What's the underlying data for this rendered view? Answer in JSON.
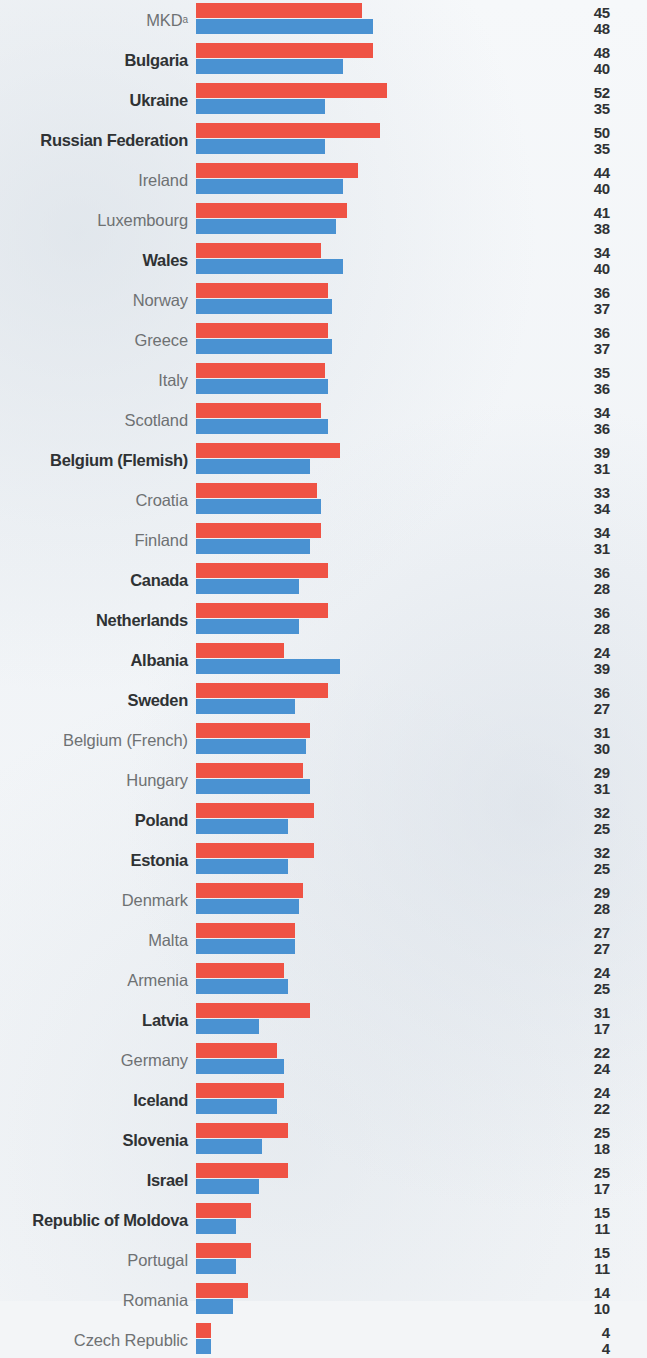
{
  "chart_data": {
    "type": "bar",
    "orientation": "horizontal",
    "grouping": "grouped",
    "title": "",
    "subtitle": "",
    "xlabel": "",
    "ylabel": "",
    "xlim": [
      0,
      55
    ],
    "grid": false,
    "legend": "none",
    "value_labels_side": "right",
    "colors": {
      "series_1": "#ef5345",
      "series_2": "#4a92d2",
      "background": "#f3f5f7",
      "label_regular": "#6e7173",
      "label_bold": "#2f3234",
      "value_text": "#2f3234"
    },
    "series": [
      {
        "name": "series_1",
        "color": "#ef5345",
        "values": [
          45,
          48,
          52,
          50,
          44,
          41,
          34,
          36,
          36,
          35,
          34,
          39,
          33,
          34,
          36,
          36,
          24,
          36,
          31,
          29,
          32,
          32,
          29,
          27,
          24,
          31,
          22,
          24,
          25,
          25,
          15,
          15,
          14,
          4
        ]
      },
      {
        "name": "series_2",
        "color": "#4a92d2",
        "values": [
          48,
          40,
          35,
          35,
          40,
          38,
          40,
          37,
          37,
          36,
          36,
          31,
          34,
          31,
          28,
          28,
          39,
          27,
          30,
          31,
          25,
          25,
          28,
          27,
          25,
          17,
          24,
          22,
          18,
          17,
          11,
          11,
          10,
          4
        ]
      }
    ],
    "categories": [
      "MKD",
      "Bulgaria",
      "Ukraine",
      "Russian Federation",
      "Ireland",
      "Luxembourg",
      "Wales",
      "Norway",
      "Greece",
      "Italy",
      "Scotland",
      "Belgium (Flemish)",
      "Croatia",
      "Finland",
      "Canada",
      "Netherlands",
      "Albania",
      "Sweden",
      "Belgium (French)",
      "Hungary",
      "Poland",
      "Estonia",
      "Denmark",
      "Malta",
      "Armenia",
      "Latvia",
      "Germany",
      "Iceland",
      "Slovenia",
      "Israel",
      "Republic of Moldova",
      "Portugal",
      "Romania",
      "Czech Republic"
    ],
    "rows": [
      {
        "label": "MKD",
        "superscript": "a",
        "bold": false,
        "red": 45,
        "blue": 48
      },
      {
        "label": "Bulgaria",
        "superscript": "",
        "bold": true,
        "red": 48,
        "blue": 40
      },
      {
        "label": "Ukraine",
        "superscript": "",
        "bold": true,
        "red": 52,
        "blue": 35
      },
      {
        "label": "Russian Federation",
        "superscript": "",
        "bold": true,
        "red": 50,
        "blue": 35
      },
      {
        "label": "Ireland",
        "superscript": "",
        "bold": false,
        "red": 44,
        "blue": 40
      },
      {
        "label": "Luxembourg",
        "superscript": "",
        "bold": false,
        "red": 41,
        "blue": 38
      },
      {
        "label": "Wales",
        "superscript": "",
        "bold": true,
        "red": 34,
        "blue": 40
      },
      {
        "label": "Norway",
        "superscript": "",
        "bold": false,
        "red": 36,
        "blue": 37
      },
      {
        "label": "Greece",
        "superscript": "",
        "bold": false,
        "red": 36,
        "blue": 37
      },
      {
        "label": "Italy",
        "superscript": "",
        "bold": false,
        "red": 35,
        "blue": 36
      },
      {
        "label": "Scotland",
        "superscript": "",
        "bold": false,
        "red": 34,
        "blue": 36
      },
      {
        "label": "Belgium (Flemish)",
        "superscript": "",
        "bold": true,
        "red": 39,
        "blue": 31
      },
      {
        "label": "Croatia",
        "superscript": "",
        "bold": false,
        "red": 33,
        "blue": 34
      },
      {
        "label": "Finland",
        "superscript": "",
        "bold": false,
        "red": 34,
        "blue": 31
      },
      {
        "label": "Canada",
        "superscript": "",
        "bold": true,
        "red": 36,
        "blue": 28
      },
      {
        "label": "Netherlands",
        "superscript": "",
        "bold": true,
        "red": 36,
        "blue": 28
      },
      {
        "label": "Albania",
        "superscript": "",
        "bold": true,
        "red": 24,
        "blue": 39
      },
      {
        "label": "Sweden",
        "superscript": "",
        "bold": true,
        "red": 36,
        "blue": 27
      },
      {
        "label": "Belgium (French)",
        "superscript": "",
        "bold": false,
        "red": 31,
        "blue": 30
      },
      {
        "label": "Hungary",
        "superscript": "",
        "bold": false,
        "red": 29,
        "blue": 31
      },
      {
        "label": "Poland",
        "superscript": "",
        "bold": true,
        "red": 32,
        "blue": 25
      },
      {
        "label": "Estonia",
        "superscript": "",
        "bold": true,
        "red": 32,
        "blue": 25
      },
      {
        "label": "Denmark",
        "superscript": "",
        "bold": false,
        "red": 29,
        "blue": 28
      },
      {
        "label": "Malta",
        "superscript": "",
        "bold": false,
        "red": 27,
        "blue": 27
      },
      {
        "label": "Armenia",
        "superscript": "",
        "bold": false,
        "red": 24,
        "blue": 25
      },
      {
        "label": "Latvia",
        "superscript": "",
        "bold": true,
        "red": 31,
        "blue": 17
      },
      {
        "label": "Germany",
        "superscript": "",
        "bold": false,
        "red": 22,
        "blue": 24
      },
      {
        "label": "Iceland",
        "superscript": "",
        "bold": true,
        "red": 24,
        "blue": 22
      },
      {
        "label": "Slovenia",
        "superscript": "",
        "bold": true,
        "red": 25,
        "blue": 18
      },
      {
        "label": "Israel",
        "superscript": "",
        "bold": true,
        "red": 25,
        "blue": 17
      },
      {
        "label": "Republic of Moldova",
        "superscript": "",
        "bold": true,
        "red": 15,
        "blue": 11
      },
      {
        "label": "Portugal",
        "superscript": "",
        "bold": false,
        "red": 15,
        "blue": 11
      },
      {
        "label": "Romania",
        "superscript": "",
        "bold": false,
        "red": 14,
        "blue": 10
      },
      {
        "label": "Czech Republic",
        "superscript": "",
        "bold": false,
        "red": 4,
        "blue": 4
      }
    ]
  },
  "layout": {
    "row_height": 40,
    "first_row_top": 0,
    "bar_origin_x": 196,
    "px_per_unit": 3.68
  }
}
